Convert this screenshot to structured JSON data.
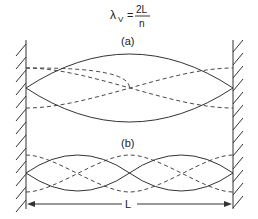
{
  "formula": {
    "lhs": "λ",
    "subscript": "V",
    "equals": "=",
    "numerator": "2L",
    "denominator": "n"
  },
  "panels": [
    {
      "label": "(a)",
      "mode": 1
    },
    {
      "label": "(b)",
      "mode": 2
    }
  ],
  "dimension": {
    "label": "L"
  },
  "colors": {
    "line": "#333333",
    "background": "#ffffff"
  }
}
